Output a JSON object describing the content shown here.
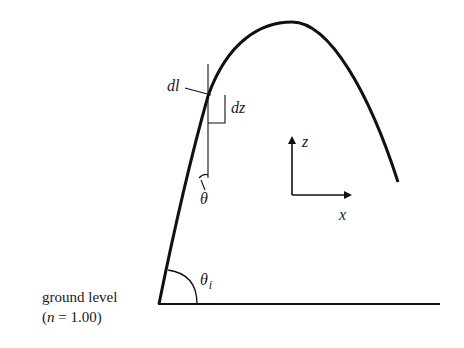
{
  "diagram": {
    "type": "ray-path-in-atmosphere",
    "colors": {
      "stroke": "#111111",
      "background": "#ffffff"
    },
    "labels": {
      "ground_level": "ground level",
      "refractive_index": "(n = 1.00)",
      "refractive_index_parts": {
        "open": "(",
        "symbol": "n",
        "rest": " = 1.00)"
      },
      "dl": "dl",
      "dz": "dz",
      "theta": "θ",
      "theta_i": {
        "symbol": "θ",
        "subscript": "i"
      },
      "axis_z": "z",
      "axis_x": "x"
    },
    "geometry": {
      "ground_line": {
        "x1": 158,
        "y1": 304,
        "x2": 440,
        "y2": 304
      },
      "ray_path": "M159,304 C172,240 190,160 208,96 C228,40 262,22 292,22 C330,22 370,95 398,182",
      "tangent_vertical": {
        "x1": 208,
        "y1": 64,
        "x2": 208,
        "y2": 178
      },
      "dz_triangle": "M208,123 L225,123 L225,95",
      "dl_leader": "M184,86 L210,92",
      "theta_arc": "M197,180 Q203,172 208,176",
      "theta_leader": "M200,183 L205,192",
      "theta_i_arc": "M168,272 Q196,276 196,304",
      "axes_origin": {
        "x": 292,
        "y": 195
      },
      "z_axis_end": {
        "x": 292,
        "y": 137
      },
      "x_axis_end": {
        "x": 352,
        "y": 195
      }
    }
  }
}
